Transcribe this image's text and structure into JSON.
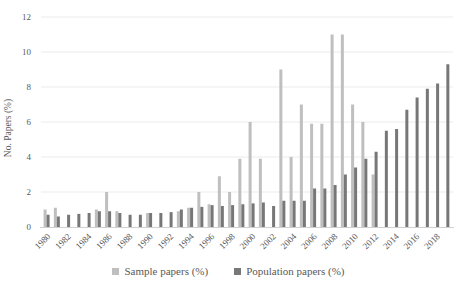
{
  "chart_data": {
    "type": "bar",
    "title": "",
    "xlabel": "",
    "ylabel": "No. Papers (%)",
    "ylim": [
      0,
      12
    ],
    "yticks": [
      0,
      2,
      4,
      6,
      8,
      10,
      12
    ],
    "grid": "faint-horizontal",
    "legend_position": "bottom",
    "categories": [
      1980,
      1981,
      1982,
      1983,
      1984,
      1985,
      1986,
      1987,
      1988,
      1989,
      1990,
      1991,
      1992,
      1993,
      1994,
      1995,
      1996,
      1997,
      1998,
      1999,
      2000,
      2001,
      2002,
      2003,
      2004,
      2005,
      2006,
      2007,
      2008,
      2009,
      2010,
      2011,
      2012,
      2013,
      2014,
      2015,
      2016,
      2017,
      2018,
      2019
    ],
    "xtick_labels": [
      "1980",
      "1982",
      "1984",
      "1986",
      "1988",
      "1990",
      "1992",
      "1994",
      "1996",
      "1998",
      "2000",
      "2002",
      "2004",
      "2006",
      "2008",
      "2010",
      "2012",
      "2014",
      "2016",
      "2018"
    ],
    "series": [
      {
        "name": "Sample papers (%)",
        "color": "#bfbfbf",
        "values": [
          1.0,
          1.1,
          0,
          0,
          0,
          1.0,
          2.0,
          0.9,
          0,
          0,
          0.8,
          0,
          0,
          0.9,
          1.1,
          2.0,
          1.3,
          2.9,
          2.0,
          3.9,
          6.0,
          3.9,
          0,
          9.0,
          4.0,
          7.0,
          5.9,
          5.9,
          11.0,
          11.0,
          7.0,
          6.0,
          3.0,
          0,
          0,
          0,
          0,
          0,
          0,
          0
        ]
      },
      {
        "name": "Population papers (%)",
        "color": "#777777",
        "values": [
          0.7,
          0.6,
          0.7,
          0.75,
          0.8,
          0.9,
          0.9,
          0.8,
          0.7,
          0.7,
          0.8,
          0.8,
          0.85,
          1.0,
          1.1,
          1.15,
          1.25,
          1.2,
          1.25,
          1.3,
          1.35,
          1.4,
          1.2,
          1.5,
          1.5,
          1.5,
          2.2,
          2.2,
          2.4,
          3.0,
          3.4,
          3.9,
          4.3,
          5.5,
          5.6,
          6.7,
          7.4,
          7.9,
          8.2,
          9.3
        ]
      }
    ]
  },
  "axis": {
    "y_label": "No. Papers (%)"
  },
  "legend": {
    "sample_label": "Sample papers (%)",
    "population_label": "Population papers (%)"
  },
  "colors": {
    "sample": "#bfbfbf",
    "population": "#777777",
    "text": "#595959",
    "grid": "#ebebeb",
    "axis_line": "#d0d0d0",
    "background": "#ffffff"
  }
}
